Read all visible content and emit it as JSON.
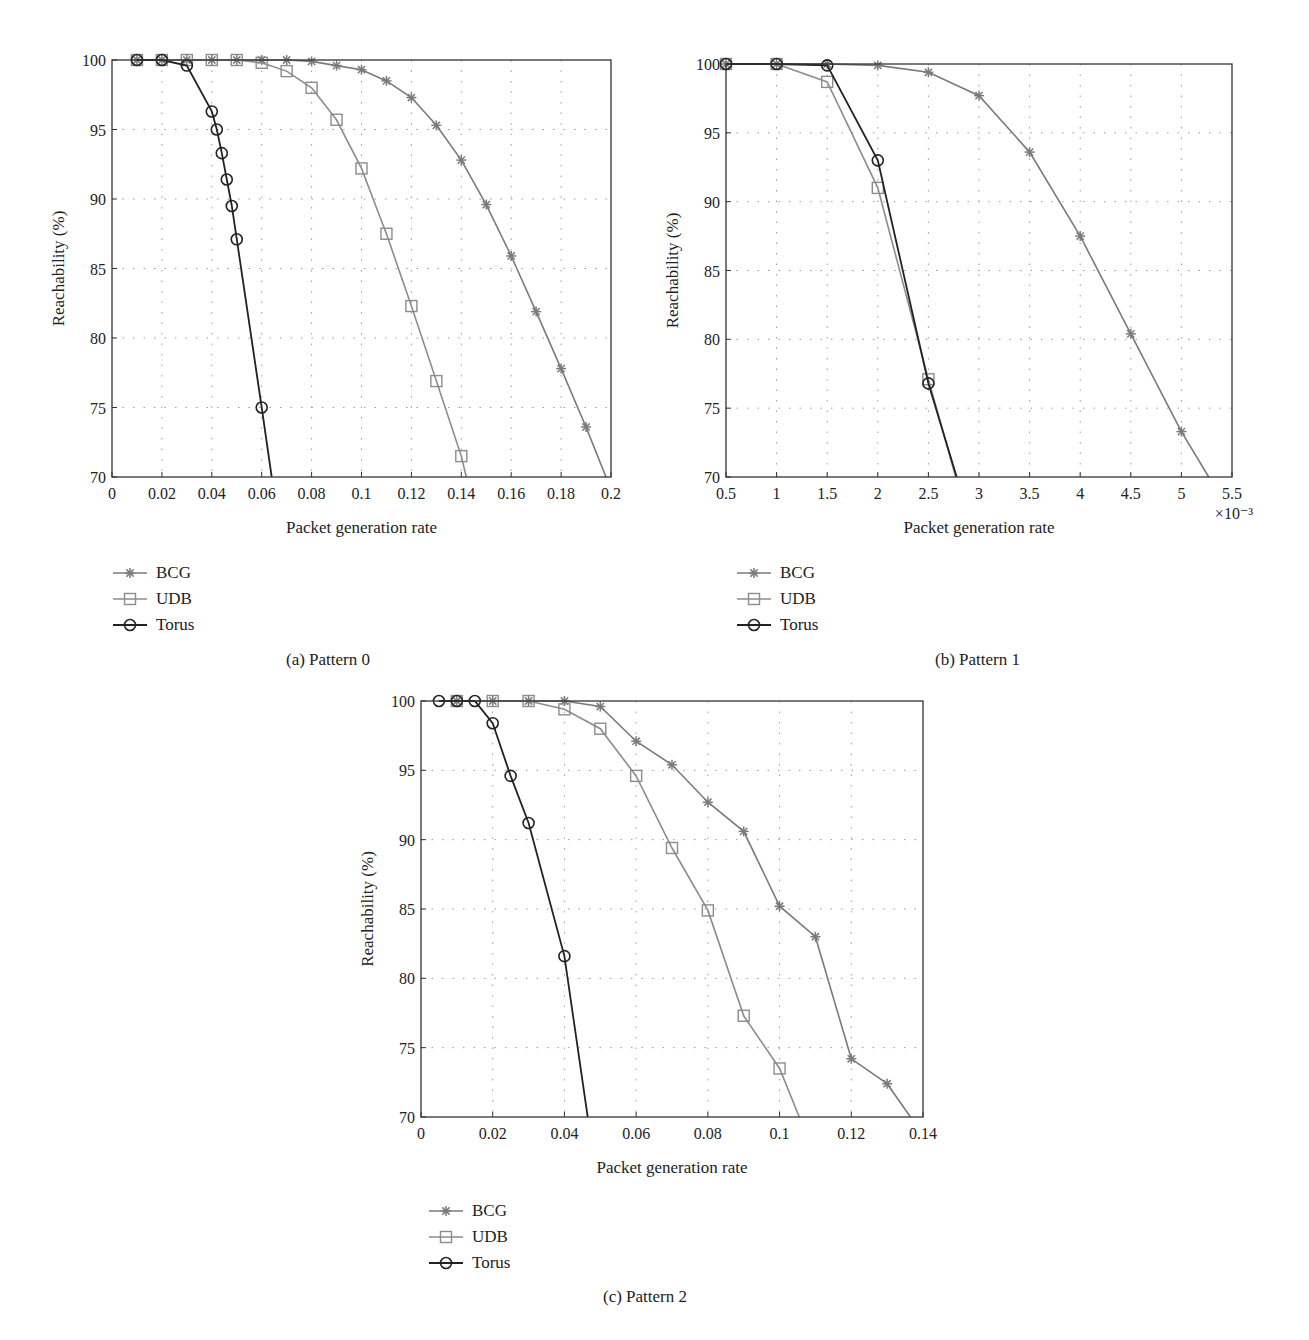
{
  "figure": {
    "panels": [
      {
        "id": "a",
        "caption": "(a)  Pattern 0"
      },
      {
        "id": "b",
        "caption": "(b)  Pattern 1"
      },
      {
        "id": "c",
        "caption": "(c)  Pattern 2"
      }
    ]
  },
  "legend": {
    "items": [
      {
        "label": "BCG",
        "marker": "star",
        "color": "#777777"
      },
      {
        "label": "UDB",
        "marker": "square",
        "color": "#8a8a8a"
      },
      {
        "label": "Torus",
        "marker": "circle",
        "color": "#222222"
      }
    ]
  },
  "chart_data": [
    {
      "type": "line",
      "title": "(a) Pattern 0",
      "xlabel": "Packet generation rate",
      "ylabel": "Reachability (%)",
      "xlim": [
        0,
        0.2
      ],
      "ylim": [
        70,
        100
      ],
      "xticks": [
        "0",
        "0.02",
        "0.04",
        "0.06",
        "0.08",
        "0.1",
        "0.12",
        "0.14",
        "0.16",
        "0.18",
        "0.2"
      ],
      "yticks": [
        "70",
        "75",
        "80",
        "85",
        "90",
        "95",
        "100"
      ],
      "grid": true,
      "legend_position": "below",
      "series": [
        {
          "name": "BCG",
          "marker": "star",
          "x": [
            0.01,
            0.02,
            0.03,
            0.04,
            0.05,
            0.06,
            0.07,
            0.08,
            0.09,
            0.1,
            0.11,
            0.12,
            0.13,
            0.14,
            0.15,
            0.16,
            0.17,
            0.18,
            0.19,
            0.198
          ],
          "y": [
            100,
            100,
            100,
            100,
            100,
            100,
            100,
            99.9,
            99.6,
            99.3,
            98.5,
            97.3,
            95.3,
            92.8,
            89.6,
            85.9,
            81.9,
            77.8,
            73.6,
            70
          ]
        },
        {
          "name": "UDB",
          "marker": "square",
          "x": [
            0.01,
            0.02,
            0.03,
            0.04,
            0.05,
            0.06,
            0.07,
            0.08,
            0.09,
            0.1,
            0.11,
            0.12,
            0.13,
            0.14,
            0.142
          ],
          "y": [
            100,
            100,
            100,
            100,
            100,
            99.8,
            99.2,
            98.0,
            95.7,
            92.2,
            87.5,
            82.3,
            76.9,
            71.5,
            70
          ]
        },
        {
          "name": "Torus",
          "marker": "circle",
          "x": [
            0.01,
            0.02,
            0.03,
            0.04,
            0.042,
            0.044,
            0.046,
            0.048,
            0.05,
            0.06,
            0.064
          ],
          "y": [
            100,
            100,
            99.6,
            96.3,
            95.0,
            93.3,
            91.4,
            89.5,
            87.1,
            75.0,
            70
          ]
        }
      ]
    },
    {
      "type": "line",
      "title": "(b) Pattern 1",
      "xlabel": "Packet generation rate",
      "ylabel": "Reachability (%)",
      "x_multiplier": "×10⁻³",
      "xlim": [
        0.5,
        5.5
      ],
      "ylim": [
        70,
        100
      ],
      "xticks": [
        "0.5",
        "1",
        "1.5",
        "2",
        "2.5",
        "3",
        "3.5",
        "4",
        "4.5",
        "5",
        "5.5"
      ],
      "yticks": [
        "70",
        "75",
        "80",
        "85",
        "90",
        "95",
        "100"
      ],
      "grid": true,
      "legend_position": "below",
      "series": [
        {
          "name": "BCG",
          "marker": "star",
          "x": [
            0.5,
            1.0,
            1.5,
            2.0,
            2.5,
            3.0,
            3.5,
            4.0,
            4.5,
            5.0,
            5.27
          ],
          "y": [
            100,
            100,
            100,
            99.9,
            99.4,
            97.7,
            93.6,
            87.5,
            80.4,
            73.3,
            70
          ]
        },
        {
          "name": "UDB",
          "marker": "square",
          "x": [
            0.5,
            1.0,
            1.5,
            2.0,
            2.5,
            2.77
          ],
          "y": [
            100,
            100,
            98.7,
            91.0,
            77.1,
            70
          ]
        },
        {
          "name": "Torus",
          "marker": "circle",
          "x": [
            0.5,
            1.0,
            1.5,
            2.0,
            2.5,
            2.78
          ],
          "y": [
            100,
            100,
            99.9,
            93.0,
            76.8,
            70
          ]
        }
      ]
    },
    {
      "type": "line",
      "title": "(c) Pattern 2",
      "xlabel": "Packet generation rate",
      "ylabel": "Reachability (%)",
      "xlim": [
        0,
        0.14
      ],
      "ylim": [
        70,
        100
      ],
      "xticks": [
        "0",
        "0.02",
        "0.04",
        "0.06",
        "0.08",
        "0.1",
        "0.12",
        "0.14"
      ],
      "yticks": [
        "70",
        "75",
        "80",
        "85",
        "90",
        "95",
        "100"
      ],
      "grid": true,
      "legend_position": "below",
      "series": [
        {
          "name": "BCG",
          "marker": "star",
          "x": [
            0.01,
            0.02,
            0.03,
            0.04,
            0.05,
            0.06,
            0.07,
            0.08,
            0.09,
            0.1,
            0.11,
            0.12,
            0.13,
            0.1365
          ],
          "y": [
            100,
            100,
            100,
            100,
            99.6,
            97.1,
            95.4,
            92.7,
            90.6,
            85.2,
            83.0,
            74.2,
            72.4,
            70
          ]
        },
        {
          "name": "UDB",
          "marker": "square",
          "x": [
            0.01,
            0.02,
            0.03,
            0.04,
            0.05,
            0.06,
            0.07,
            0.08,
            0.09,
            0.1,
            0.1055
          ],
          "y": [
            100,
            100,
            100,
            99.4,
            98.0,
            94.6,
            89.4,
            84.9,
            77.3,
            73.5,
            70
          ]
        },
        {
          "name": "Torus",
          "marker": "circle",
          "x": [
            0.005,
            0.01,
            0.015,
            0.02,
            0.025,
            0.03,
            0.04,
            0.0465
          ],
          "y": [
            100,
            100,
            100,
            98.4,
            94.6,
            91.2,
            81.6,
            70
          ]
        }
      ]
    }
  ]
}
